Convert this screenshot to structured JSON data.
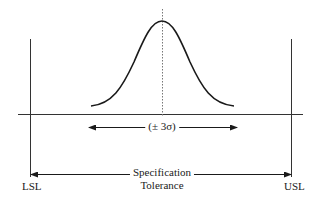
{
  "diagram": {
    "type": "process-capability",
    "labels": {
      "sigma_range": "(± 3σ)",
      "spec_line1": "Specification",
      "spec_line2": "Tolerance",
      "lsl": "LSL",
      "usl": "USL"
    },
    "colors": {
      "line": "#1a1a1a",
      "axis": "#333333",
      "dotted": "#777777"
    },
    "elements": {
      "lsl_line_x": 30,
      "usl_line_x": 291,
      "baseline_y": 114,
      "curve_peak": [
        162,
        21
      ],
      "curve_ends": [
        [
          91,
          106
        ],
        [
          234,
          106
        ]
      ]
    }
  }
}
